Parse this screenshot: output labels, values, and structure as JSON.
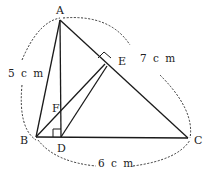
{
  "diagram": {
    "type": "geometry-triangle",
    "points": {
      "A": {
        "label": "A",
        "x": 60,
        "y": 20
      },
      "B": {
        "label": "B",
        "x": 36,
        "y": 137
      },
      "C": {
        "label": "C",
        "x": 188,
        "y": 138
      },
      "D": {
        "label": "D",
        "x": 61,
        "y": 137
      },
      "E": {
        "label": "E",
        "x": 105,
        "y": 64
      },
      "F": {
        "label": "F",
        "x": 61,
        "y": 113
      }
    },
    "segments": [
      "AB",
      "AC",
      "BC",
      "AD",
      "BE",
      "DE"
    ],
    "right_angles": [
      "ADB",
      "AEB"
    ],
    "lengths": {
      "AB": "5 c m",
      "AC": "7 c m",
      "BC": "6 c m"
    }
  }
}
